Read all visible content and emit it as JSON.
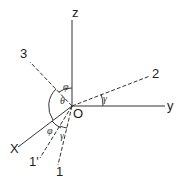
{
  "diagram": {
    "axes": {
      "z": "z",
      "y": "y",
      "x": "X",
      "origin": "O"
    },
    "lines": {
      "three": "3",
      "two": "2",
      "one": "1",
      "one_prime": "1'"
    },
    "angles": {
      "phi_top": "φ",
      "theta": "θ",
      "gamma_right": "γ",
      "phi_bottom": "φ",
      "gamma_bottom": "γ"
    }
  }
}
